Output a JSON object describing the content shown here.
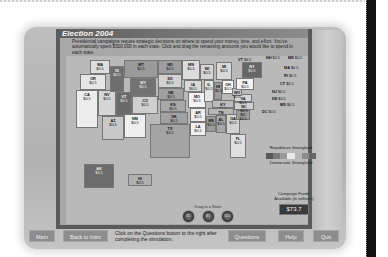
{
  "window": {
    "title": "Election 2004"
  },
  "instructions": "Presidential campaigns require strategic decisions on where to spend your money, time, and effort. You've automatically spent $500,000 in each state. Click and drag the remaining amounts you would like to spend in each state.",
  "states": [
    {
      "abbr": "WA",
      "value": "$0.5",
      "x": 24,
      "y": 4,
      "w": 20,
      "h": 14,
      "shade": "#dedede"
    },
    {
      "abbr": "OR",
      "value": "$0.5",
      "x": 14,
      "y": 18,
      "w": 26,
      "h": 16,
      "shade": "#e6e6e6"
    },
    {
      "abbr": "CA",
      "value": "$0.5",
      "x": 10,
      "y": 34,
      "w": 22,
      "h": 38,
      "shade": "#ededed"
    },
    {
      "abbr": "NV",
      "value": "$0.5",
      "x": 32,
      "y": 34,
      "w": 18,
      "h": 26,
      "shade": "#d6d6d6"
    },
    {
      "abbr": "ID",
      "value": "$0.5",
      "x": 44,
      "y": 10,
      "w": 14,
      "h": 26,
      "shade": "#6e6e6e"
    },
    {
      "abbr": "MT",
      "value": "$0.5",
      "x": 58,
      "y": 4,
      "w": 34,
      "h": 18,
      "shade": "#9a9a9a"
    },
    {
      "abbr": "WY",
      "value": "$0.5",
      "x": 64,
      "y": 22,
      "w": 26,
      "h": 18,
      "shade": "#727272"
    },
    {
      "abbr": "UT",
      "value": "$0.5",
      "x": 50,
      "y": 36,
      "w": 16,
      "h": 24,
      "shade": "#6a6a6a"
    },
    {
      "abbr": "CO",
      "value": "$0.5",
      "x": 66,
      "y": 40,
      "w": 26,
      "h": 18,
      "shade": "#cfcfcf"
    },
    {
      "abbr": "AZ",
      "value": "$0.5",
      "x": 36,
      "y": 60,
      "w": 22,
      "h": 24,
      "shade": "#c8c8c8"
    },
    {
      "abbr": "NM",
      "value": "$0.5",
      "x": 58,
      "y": 58,
      "w": 22,
      "h": 24,
      "shade": "#efefef"
    },
    {
      "abbr": "ND",
      "value": "$0.5",
      "x": 92,
      "y": 4,
      "w": 24,
      "h": 14,
      "shade": "#9e9e9e"
    },
    {
      "abbr": "SD",
      "value": "$0.5",
      "x": 92,
      "y": 18,
      "w": 24,
      "h": 14,
      "shade": "#d2d2d2"
    },
    {
      "abbr": "NE",
      "value": "$0.5",
      "x": 92,
      "y": 32,
      "w": 26,
      "h": 12,
      "shade": "#a0a0a0"
    },
    {
      "abbr": "KS",
      "value": "$0.5",
      "x": 94,
      "y": 44,
      "w": 26,
      "h": 12,
      "shade": "#a8a8a8"
    },
    {
      "abbr": "OK",
      "value": "$0.5",
      "x": 94,
      "y": 56,
      "w": 28,
      "h": 12,
      "shade": "#a2a2a2"
    },
    {
      "abbr": "TX",
      "value": "$0.5",
      "x": 84,
      "y": 68,
      "w": 40,
      "h": 34,
      "shade": "#a4a4a4"
    },
    {
      "abbr": "MN",
      "value": "$0.5",
      "x": 116,
      "y": 4,
      "w": 18,
      "h": 20,
      "shade": "#dcdcdc"
    },
    {
      "abbr": "IA",
      "value": "$0.5",
      "x": 118,
      "y": 24,
      "w": 18,
      "h": 12,
      "shade": "#d8d8d8"
    },
    {
      "abbr": "MO",
      "value": "$0.5",
      "x": 122,
      "y": 36,
      "w": 18,
      "h": 16,
      "shade": "#f2f2f2"
    },
    {
      "abbr": "AR",
      "value": "$0.5",
      "x": 124,
      "y": 52,
      "w": 16,
      "h": 14,
      "shade": "#eeeeee"
    },
    {
      "abbr": "LA",
      "value": "$0.5",
      "x": 124,
      "y": 66,
      "w": 16,
      "h": 14,
      "shade": "#f0f0f0"
    },
    {
      "abbr": "WI",
      "value": "$0.5",
      "x": 134,
      "y": 8,
      "w": 14,
      "h": 16,
      "shade": "#d4d4d4"
    },
    {
      "abbr": "IL",
      "value": "$0.5",
      "x": 138,
      "y": 24,
      "w": 10,
      "h": 22,
      "shade": "#e4e4e4"
    },
    {
      "abbr": "MI",
      "value": "$0.5",
      "x": 150,
      "y": 6,
      "w": 16,
      "h": 18,
      "shade": "#d8d8d8"
    },
    {
      "abbr": "IN",
      "value": "$0.5",
      "x": 148,
      "y": 26,
      "w": 8,
      "h": 18,
      "shade": "#9c9c9c"
    },
    {
      "abbr": "OH",
      "value": "$0.5",
      "x": 156,
      "y": 24,
      "w": 12,
      "h": 14,
      "shade": "#f6f6f6"
    },
    {
      "abbr": "KY",
      "value": "$0.5",
      "x": 146,
      "y": 44,
      "w": 22,
      "h": 8,
      "shade": "#bcbcbc"
    },
    {
      "abbr": "TN",
      "value": "$0.5",
      "x": 142,
      "y": 52,
      "w": 26,
      "h": 7,
      "shade": "#b6b6b6"
    },
    {
      "abbr": "MS",
      "value": "$0.5",
      "x": 140,
      "y": 60,
      "w": 10,
      "h": 16,
      "shade": "#9a9a9a"
    },
    {
      "abbr": "AL",
      "value": "$0.5",
      "x": 150,
      "y": 59,
      "w": 10,
      "h": 18,
      "shade": "#a6a6a6"
    },
    {
      "abbr": "GA",
      "value": "$0.5",
      "x": 160,
      "y": 58,
      "w": 14,
      "h": 20,
      "shade": "#d2d2d2"
    },
    {
      "abbr": "FL",
      "value": "$0.5",
      "x": 164,
      "y": 78,
      "w": 16,
      "h": 24,
      "shade": "#e0e0e0"
    },
    {
      "abbr": "SC",
      "value": "$0.5",
      "x": 170,
      "y": 54,
      "w": 14,
      "h": 10,
      "shade": "#9e9e9e"
    },
    {
      "abbr": "NC",
      "value": "$0.5",
      "x": 168,
      "y": 46,
      "w": 20,
      "h": 8,
      "shade": "#d0d0d0"
    },
    {
      "abbr": "VA",
      "value": "$0.5",
      "x": 168,
      "y": 38,
      "w": 18,
      "h": 8,
      "shade": "#d6d6d6"
    },
    {
      "abbr": "WV",
      "value": "$0.5",
      "x": 166,
      "y": 32,
      "w": 10,
      "h": 8,
      "shade": "#c6c6c6"
    },
    {
      "abbr": "PA",
      "value": "$0.5",
      "x": 170,
      "y": 22,
      "w": 18,
      "h": 12,
      "shade": "#f2f2f2"
    },
    {
      "abbr": "NY",
      "value": "$0.5",
      "x": 176,
      "y": 6,
      "w": 20,
      "h": 16,
      "shade": "#666666"
    }
  ],
  "callouts": [
    {
      "abbr": "VT",
      "value": "$0.5",
      "x": 172,
      "y": 2
    },
    {
      "abbr": "NH",
      "value": "$0.5",
      "x": 200,
      "y": 0
    },
    {
      "abbr": "ME",
      "value": "$0.5",
      "x": 222,
      "y": 0
    },
    {
      "abbr": "MA",
      "value": "$0.5",
      "x": 218,
      "y": 10
    },
    {
      "abbr": "RI",
      "value": "$0.5",
      "x": 218,
      "y": 18
    },
    {
      "abbr": "CT",
      "value": "$0.5",
      "x": 214,
      "y": 26
    },
    {
      "abbr": "NJ",
      "value": "$0.5",
      "x": 206,
      "y": 34
    },
    {
      "abbr": "DE",
      "value": "$0.5",
      "x": 206,
      "y": 41
    },
    {
      "abbr": "MD",
      "value": "$0.5",
      "x": 214,
      "y": 47
    },
    {
      "abbr": "DC",
      "value": "$0.5",
      "x": 196,
      "y": 54
    }
  ],
  "offshore": [
    {
      "abbr": "AK",
      "value": "$0.5",
      "x": 18,
      "y": 108,
      "w": 30,
      "h": 24,
      "shade": "#6c6c6c"
    },
    {
      "abbr": "HI",
      "value": "$0.5",
      "x": 62,
      "y": 118,
      "w": 24,
      "h": 12,
      "shade": "#b0b0b0"
    }
  ],
  "legend": {
    "top_label": "Republican Stronghold",
    "bottom_label": "Democratic Stronghold",
    "scale": [
      "#5a5a5a",
      "#7a7a7a",
      "#9a9a9a",
      "#e8e8e8",
      "#b6b6b6",
      "#8c8c8c",
      "#666666"
    ]
  },
  "drag": {
    "label": "Drag to a State",
    "tokens": [
      "$1",
      "$5",
      "$10"
    ]
  },
  "funds": {
    "label": "Campaign Funds Available (in millions)",
    "value": "$73.7"
  },
  "footer": {
    "main_label": "Main",
    "back_label": "Back to Intro",
    "hint": "Click on the Questions button to the right after completing the simulation.",
    "questions_label": "Questions",
    "help_label": "Help",
    "quit_label": "Quit"
  }
}
